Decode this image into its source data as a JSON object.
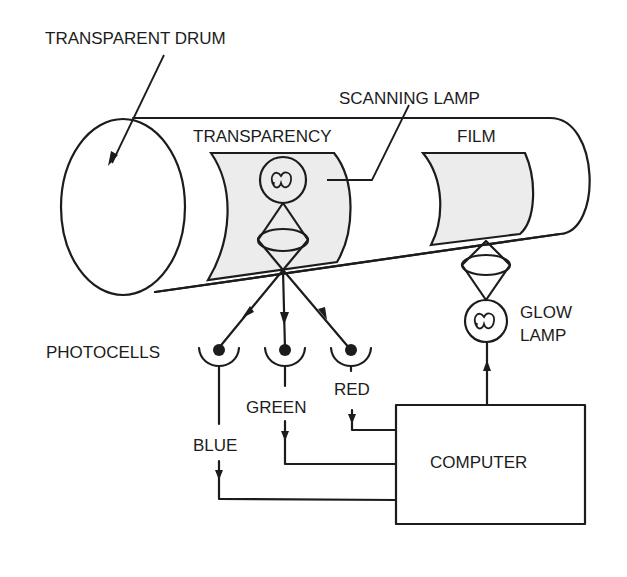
{
  "diagram": {
    "type": "schematic",
    "labels": {
      "transparent_drum": "TRANSPARENT DRUM",
      "scanning_lamp": "SCANNING LAMP",
      "transparency": "TRANSPARENCY",
      "film": "FILM",
      "photocells": "PHOTOCELLS",
      "green": "GREEN",
      "red": "RED",
      "blue": "BLUE",
      "glow_lamp_line1": "GLOW",
      "glow_lamp_line2": "LAMP",
      "computer": "COMPUTER"
    },
    "nodes": [
      {
        "id": "transparent-drum",
        "label": "TRANSPARENT DRUM"
      },
      {
        "id": "transparency",
        "label": "TRANSPARENCY"
      },
      {
        "id": "scanning-lamp",
        "label": "SCANNING LAMP"
      },
      {
        "id": "film",
        "label": "FILM"
      },
      {
        "id": "photocell-blue",
        "label": "BLUE"
      },
      {
        "id": "photocell-green",
        "label": "GREEN"
      },
      {
        "id": "photocell-red",
        "label": "RED"
      },
      {
        "id": "computer",
        "label": "COMPUTER"
      },
      {
        "id": "glow-lamp",
        "label": "GLOW LAMP"
      }
    ],
    "edges": [
      {
        "from": "scanning-lamp",
        "to": "photocell-blue"
      },
      {
        "from": "scanning-lamp",
        "to": "photocell-green"
      },
      {
        "from": "scanning-lamp",
        "to": "photocell-red"
      },
      {
        "from": "photocell-blue",
        "to": "computer"
      },
      {
        "from": "photocell-green",
        "to": "computer"
      },
      {
        "from": "photocell-red",
        "to": "computer"
      },
      {
        "from": "computer",
        "to": "glow-lamp"
      },
      {
        "from": "glow-lamp",
        "to": "film"
      }
    ],
    "colors": {
      "ink": "#1c1c1c",
      "sheet_fill": "#ececec",
      "background": "#ffffff"
    }
  }
}
